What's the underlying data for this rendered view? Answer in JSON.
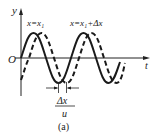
{
  "diagram": {
    "axes": {
      "y_label": "y",
      "x_label": "t",
      "origin_label": "O"
    },
    "curves": [
      {
        "name": "solid",
        "label": "x=x₁",
        "style": "solid"
      },
      {
        "name": "dashed",
        "label": "x=x₁+Δx",
        "style": "dashed"
      }
    ],
    "shift_annotation": {
      "numerator": "Δx",
      "denominator": "u"
    },
    "caption": "(a)",
    "colors": {
      "line": "#1a1a1a",
      "background": "#ffffff"
    }
  }
}
